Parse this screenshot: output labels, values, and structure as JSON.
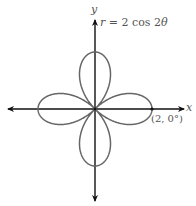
{
  "figure": {
    "type": "polar rose curve",
    "equation_label": "r = 2 cos 2θ",
    "equation_parts": {
      "r": "r",
      "rest": " = 2 cos 2",
      "theta": "θ"
    },
    "x_axis_label": "x",
    "y_axis_label": "y",
    "point_label": "(2, 0°)",
    "amplitude": 2,
    "petal_count": 4,
    "colors": {
      "curve": "#666666",
      "axis": "#111111",
      "text": "#555555"
    }
  }
}
